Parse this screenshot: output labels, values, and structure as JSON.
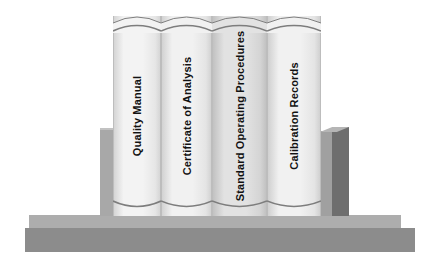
{
  "illustration": {
    "title": "Quality Documentation Bookshelf",
    "description": "Four upright binders held between two bookends on a shelf"
  },
  "palette": {
    "background": "#ffffff",
    "shelf_slab": "#8c8c8c",
    "shelf_ledge": "#adadad",
    "bookend_left": "#a8a8a8",
    "bookend_right_front": "#a0a0a0",
    "bookend_right_side": "#6e6e6e",
    "book_edge_line": "#7d7d7d",
    "book_text": "#121212"
  },
  "books": [
    {
      "label": "Quality Manual",
      "left": 113,
      "width": 48,
      "fill_light": "#f3f3f3",
      "fill_mid": "#e6e6e6",
      "fill_dark": "#d2d2d2"
    },
    {
      "label": "Certificate of Analysis",
      "left": 161,
      "width": 51,
      "fill_light": "#f1f1f1",
      "fill_mid": "#e4e4e4",
      "fill_dark": "#cfcfcf"
    },
    {
      "label": "Standard Operating Procedures",
      "left": 212,
      "width": 55,
      "fill_light": "#e2e2e2",
      "fill_mid": "#d4d4d4",
      "fill_dark": "#bfbfbf"
    },
    {
      "label": "Calibration Records",
      "left": 267,
      "width": 54,
      "fill_light": "#f1f1f1",
      "fill_mid": "#e4e4e4",
      "fill_dark": "#cdcdcd"
    }
  ],
  "shelf": {
    "slab_label": "shelf-slab",
    "ledge_label": "shelf-ledge"
  },
  "bookends": {
    "left_label": "left-bookend",
    "right_label": "right-bookend"
  }
}
